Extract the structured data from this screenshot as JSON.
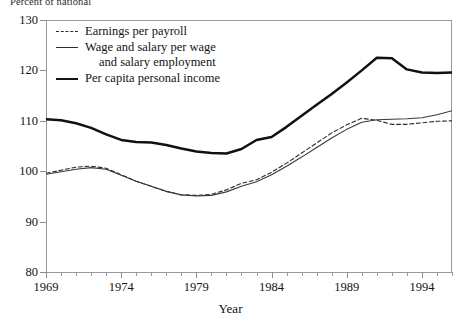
{
  "title": "Percent of national",
  "axis": {
    "ylabel_top": "Percent of national",
    "xlabel": "Year",
    "yticks": [
      130,
      120,
      110,
      100,
      90,
      80
    ],
    "xticks": [
      1969,
      1974,
      1979,
      1984,
      1989,
      1994
    ]
  },
  "legend": {
    "items": [
      {
        "label": "Earnings per payroll",
        "style": "dashed"
      },
      {
        "label": "Wage and salary per wage",
        "style": "thin"
      },
      {
        "label": "and salary employment",
        "style": "continuation"
      },
      {
        "label": "Per capita personal income",
        "style": "thick"
      }
    ]
  },
  "chart_data": {
    "type": "line",
    "title": "Percent of national",
    "xlabel": "Year",
    "ylabel": "Percent of national",
    "xlim": [
      1969,
      1996
    ],
    "ylim": [
      80,
      130
    ],
    "grid": false,
    "legend_position": "top-left",
    "x": [
      1969,
      1970,
      1971,
      1972,
      1973,
      1974,
      1975,
      1976,
      1977,
      1978,
      1979,
      1980,
      1981,
      1982,
      1983,
      1984,
      1985,
      1986,
      1987,
      1988,
      1989,
      1990,
      1991,
      1992,
      1993,
      1994,
      1995,
      1996
    ],
    "series": [
      {
        "name": "Earnings per payroll",
        "style": "dashed",
        "values": [
          99.6,
          100.2,
          100.8,
          101.0,
          100.6,
          99.3,
          98.0,
          97.0,
          96.0,
          95.3,
          95.2,
          95.4,
          96.3,
          97.6,
          98.3,
          99.8,
          101.6,
          103.6,
          105.6,
          107.6,
          109.2,
          110.5,
          110.1,
          109.3,
          109.3,
          109.6,
          109.9,
          110.0
        ]
      },
      {
        "name": "Wage and salary per wage and salary employment",
        "style": "solid-thin",
        "values": [
          99.4,
          99.9,
          100.4,
          100.7,
          100.4,
          99.2,
          98.0,
          97.0,
          96.0,
          95.3,
          95.1,
          95.2,
          95.9,
          97.0,
          97.9,
          99.3,
          101.0,
          102.8,
          104.7,
          106.6,
          108.3,
          109.7,
          110.2,
          110.3,
          110.4,
          110.6,
          111.2,
          112.0
        ]
      },
      {
        "name": "Per capita personal income",
        "style": "solid-thick",
        "values": [
          110.3,
          110.1,
          109.5,
          108.6,
          107.3,
          106.2,
          105.8,
          105.7,
          105.2,
          104.5,
          103.9,
          103.6,
          103.5,
          104.4,
          106.2,
          106.8,
          108.8,
          111.0,
          113.2,
          115.3,
          117.6,
          120.0,
          122.5,
          122.4,
          120.2,
          119.6,
          119.5,
          119.6
        ]
      }
    ]
  }
}
